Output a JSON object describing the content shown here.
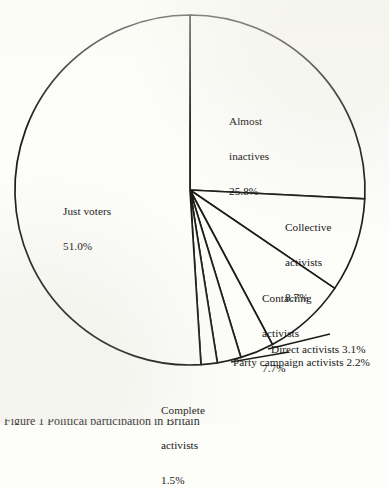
{
  "figure": {
    "name": "political-participation-pie-chart",
    "background_color": "#fdfdfa",
    "line_color": "#1c1c1c",
    "bottom_caption_partial": "Figure 1 Political participation in Britain"
  },
  "geometry": {
    "center_x": 190,
    "center_y": 190,
    "radius": 175,
    "start_angle_deg": 0,
    "direction": "clockwise"
  },
  "labels": {
    "almost_inactives": {
      "line1": "Almost",
      "line2": "inactives",
      "line3": "25.8%"
    },
    "just_voters": {
      "line1": "Just voters",
      "line2": "51.0%"
    },
    "collective": {
      "line1": "Collective",
      "line2": "activists",
      "line3": "8.7%"
    },
    "contacting": {
      "line1": "Contacting",
      "line2": "activists",
      "line3": "7.7%"
    },
    "direct": {
      "line1": "Direct activists 3.1%"
    },
    "party_campaign": {
      "line1": "Party campaign activists 2.2%"
    },
    "complete": {
      "line1": "Complete",
      "line2": "activists",
      "line3": "1.5%"
    }
  },
  "chart_data": {
    "type": "pie",
    "title": "",
    "categories": [
      "Almost inactives",
      "Collective activists",
      "Contacting activists",
      "Direct activists",
      "Party campaign activists",
      "Complete activists",
      "Just voters"
    ],
    "values": [
      25.8,
      8.7,
      7.7,
      3.1,
      2.2,
      1.5,
      51.0
    ],
    "value_labels": [
      "25.8%",
      "8.7%",
      "7.7%",
      "3.1%",
      "2.2%",
      "1.5%",
      "51.0%"
    ],
    "units": "percent",
    "total": 100.0,
    "start_angle_deg": 0,
    "direction": "clockwise",
    "slice_fill": "#fdfdfa",
    "slice_stroke": "#1c1c1c",
    "legend": "none",
    "labels_position": "inside-and-leader-lines",
    "grid": false
  }
}
